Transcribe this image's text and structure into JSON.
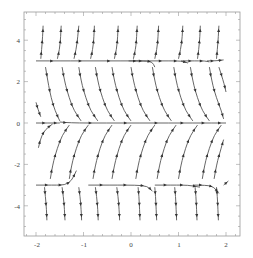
{
  "chart_data": {
    "type": "streamplot",
    "title": "",
    "xlabel": "",
    "ylabel": "",
    "xlim": [
      -2.25,
      2.25
    ],
    "ylim": [
      -5.4,
      5.4
    ],
    "grid": false,
    "legend": null,
    "x_ticks": [
      -2,
      -1,
      0,
      1,
      2
    ],
    "y_ticks": [
      -4,
      -2,
      0,
      2,
      4
    ],
    "x_tick_labels": [
      "-2",
      "-1",
      "0",
      "1",
      "2"
    ],
    "y_tick_labels": [
      "-4",
      "-2",
      "0",
      "2",
      "4"
    ],
    "separatrices_y": [
      3,
      0,
      -3
    ],
    "colors": {
      "stream": "#555555",
      "arrow": "#333333",
      "frame": "#999999",
      "text": "#444444"
    },
    "streamlines": [
      {
        "pts": [
          [
            -2,
            3
          ],
          [
            -1.4,
            3
          ],
          [
            -0.8,
            3
          ],
          [
            -0.2,
            3
          ],
          [
            0.3,
            3
          ],
          [
            0.45,
            2.95
          ],
          [
            0.5,
            2.7
          ]
        ]
      },
      {
        "pts": [
          [
            -0.05,
            3
          ],
          [
            0.4,
            3
          ],
          [
            0.8,
            3
          ],
          [
            1.05,
            3
          ],
          [
            1.2,
            2.9
          ]
        ]
      },
      {
        "pts": [
          [
            1.05,
            3
          ],
          [
            1.4,
            3
          ],
          [
            1.55,
            3
          ],
          [
            1.65,
            2.95
          ]
        ]
      },
      {
        "pts": [
          [
            1.6,
            3
          ],
          [
            1.8,
            3
          ],
          [
            1.95,
            3.05
          ]
        ]
      },
      {
        "pts": [
          [
            -2,
            0
          ],
          [
            -1.7,
            0
          ],
          [
            -1.5,
            0
          ]
        ]
      },
      {
        "pts": [
          [
            -1.5,
            0.05
          ],
          [
            -1.3,
            0
          ],
          [
            -0.5,
            0
          ],
          [
            0.2,
            0
          ],
          [
            0.8,
            0
          ],
          [
            1.3,
            0
          ],
          [
            1.7,
            0
          ],
          [
            2,
            0
          ]
        ]
      },
      {
        "pts": [
          [
            -2,
            -3
          ],
          [
            -1.6,
            -3
          ],
          [
            -1.4,
            -3
          ],
          [
            -1.25,
            -2.8
          ],
          [
            -1.15,
            -2.3
          ]
        ]
      },
      {
        "pts": [
          [
            -0.9,
            -3
          ],
          [
            -0.4,
            -3
          ],
          [
            0.1,
            -3
          ],
          [
            0.35,
            -3.05
          ],
          [
            0.45,
            -3.3
          ]
        ]
      },
      {
        "pts": [
          [
            0.5,
            -3
          ],
          [
            0.9,
            -3
          ],
          [
            1.2,
            -3
          ],
          [
            1.45,
            -3.1
          ]
        ]
      },
      {
        "pts": [
          [
            1.3,
            -3
          ],
          [
            1.6,
            -3
          ],
          [
            1.75,
            -3.1
          ],
          [
            1.85,
            -3.4
          ]
        ]
      },
      {
        "pts": [
          [
            1.95,
            -3
          ],
          [
            2.05,
            -2.8
          ]
        ]
      },
      {
        "pts": [
          [
            -1.9,
            3.1
          ],
          [
            -1.88,
            3.6
          ],
          [
            -1.86,
            4.2
          ],
          [
            -1.85,
            4.7
          ]
        ]
      },
      {
        "pts": [
          [
            -1.55,
            3.1
          ],
          [
            -1.5,
            3.6
          ],
          [
            -1.48,
            4.2
          ],
          [
            -1.47,
            4.7
          ]
        ]
      },
      {
        "pts": [
          [
            -1.2,
            3.1
          ],
          [
            -1.15,
            3.6
          ],
          [
            -1.12,
            4.2
          ],
          [
            -1.1,
            4.7
          ]
        ]
      },
      {
        "pts": [
          [
            -0.85,
            3.1
          ],
          [
            -0.8,
            3.6
          ],
          [
            -0.78,
            4.2
          ],
          [
            -0.77,
            4.7
          ]
        ]
      },
      {
        "pts": [
          [
            -0.35,
            3.1
          ],
          [
            -0.3,
            3.6
          ],
          [
            -0.28,
            4.2
          ],
          [
            -0.27,
            4.7
          ]
        ]
      },
      {
        "pts": [
          [
            0.05,
            3.1
          ],
          [
            0.1,
            3.6
          ],
          [
            0.12,
            4.2
          ],
          [
            0.13,
            4.7
          ]
        ]
      },
      {
        "pts": [
          [
            0.5,
            3.1
          ],
          [
            0.55,
            3.6
          ],
          [
            0.57,
            4.2
          ],
          [
            0.58,
            4.7
          ]
        ]
      },
      {
        "pts": [
          [
            1.0,
            3.1
          ],
          [
            1.05,
            3.6
          ],
          [
            1.08,
            4.2
          ],
          [
            1.09,
            4.7
          ]
        ]
      },
      {
        "pts": [
          [
            1.4,
            3.1
          ],
          [
            1.43,
            3.6
          ],
          [
            1.45,
            4.2
          ],
          [
            1.46,
            4.7
          ]
        ]
      },
      {
        "pts": [
          [
            1.8,
            3.1
          ],
          [
            1.82,
            3.6
          ],
          [
            1.84,
            4.2
          ],
          [
            1.85,
            4.7
          ]
        ]
      },
      {
        "pts": [
          [
            -1.8,
            2.7
          ],
          [
            -1.75,
            2.0
          ],
          [
            -1.68,
            1.2
          ],
          [
            -1.6,
            0.6
          ],
          [
            -1.5,
            0.1
          ]
        ]
      },
      {
        "pts": [
          [
            -1.45,
            2.7
          ],
          [
            -1.4,
            2.0
          ],
          [
            -1.3,
            1.2
          ],
          [
            -1.2,
            0.6
          ],
          [
            -1.05,
            0.1
          ]
        ]
      },
      {
        "pts": [
          [
            -1.1,
            2.7
          ],
          [
            -1.05,
            2.0
          ],
          [
            -0.95,
            1.2
          ],
          [
            -0.85,
            0.6
          ],
          [
            -0.7,
            0.1
          ]
        ]
      },
      {
        "pts": [
          [
            -0.75,
            2.7
          ],
          [
            -0.7,
            2.0
          ],
          [
            -0.6,
            1.2
          ],
          [
            -0.5,
            0.6
          ],
          [
            -0.35,
            0.1
          ]
        ]
      },
      {
        "pts": [
          [
            -0.4,
            2.7
          ],
          [
            -0.35,
            2.0
          ],
          [
            -0.25,
            1.2
          ],
          [
            -0.15,
            0.6
          ],
          [
            0.0,
            0.1
          ]
        ]
      },
      {
        "pts": [
          [
            0.0,
            2.7
          ],
          [
            0.05,
            2.0
          ],
          [
            0.15,
            1.2
          ],
          [
            0.25,
            0.6
          ],
          [
            0.4,
            0.1
          ]
        ]
      },
      {
        "pts": [
          [
            0.45,
            2.7
          ],
          [
            0.5,
            2.0
          ],
          [
            0.6,
            1.2
          ],
          [
            0.7,
            0.6
          ],
          [
            0.85,
            0.1
          ]
        ]
      },
      {
        "pts": [
          [
            0.9,
            2.7
          ],
          [
            0.95,
            2.0
          ],
          [
            1.05,
            1.2
          ],
          [
            1.15,
            0.6
          ],
          [
            1.3,
            0.1
          ]
        ]
      },
      {
        "pts": [
          [
            1.25,
            2.7
          ],
          [
            1.3,
            2.0
          ],
          [
            1.4,
            1.2
          ],
          [
            1.5,
            0.6
          ],
          [
            1.65,
            0.1
          ]
        ]
      },
      {
        "pts": [
          [
            1.65,
            2.7
          ],
          [
            1.7,
            2.0
          ],
          [
            1.8,
            1.2
          ],
          [
            1.9,
            0.6
          ],
          [
            1.95,
            0.2
          ]
        ]
      },
      {
        "pts": [
          [
            1.85,
            2.7
          ],
          [
            1.95,
            2.0
          ],
          [
            2.0,
            1.5
          ]
        ]
      },
      {
        "pts": [
          [
            -2.0,
            1.0
          ],
          [
            -1.95,
            0.6
          ],
          [
            -1.9,
            0.3
          ]
        ]
      },
      {
        "pts": [
          [
            -1.95,
            -1.2
          ],
          [
            -1.9,
            -0.7
          ],
          [
            -1.8,
            -0.3
          ],
          [
            -1.65,
            -0.05
          ]
        ]
      },
      {
        "pts": [
          [
            -1.7,
            -2.7
          ],
          [
            -1.65,
            -2.0
          ],
          [
            -1.55,
            -1.2
          ],
          [
            -1.45,
            -0.6
          ],
          [
            -1.3,
            -0.1
          ]
        ]
      },
      {
        "pts": [
          [
            -1.3,
            -2.7
          ],
          [
            -1.25,
            -2.0
          ],
          [
            -1.15,
            -1.2
          ],
          [
            -1.05,
            -0.6
          ],
          [
            -0.9,
            -0.1
          ]
        ]
      },
      {
        "pts": [
          [
            -0.8,
            -2.7
          ],
          [
            -0.75,
            -2.0
          ],
          [
            -0.65,
            -1.2
          ],
          [
            -0.55,
            -0.6
          ],
          [
            -0.4,
            -0.1
          ]
        ]
      },
      {
        "pts": [
          [
            -0.4,
            -2.7
          ],
          [
            -0.35,
            -2.0
          ],
          [
            -0.25,
            -1.2
          ],
          [
            -0.15,
            -0.6
          ],
          [
            0.0,
            -0.1
          ]
        ]
      },
      {
        "pts": [
          [
            0.1,
            -2.7
          ],
          [
            0.15,
            -2.0
          ],
          [
            0.25,
            -1.2
          ],
          [
            0.35,
            -0.6
          ],
          [
            0.5,
            -0.1
          ]
        ]
      },
      {
        "pts": [
          [
            0.55,
            -2.7
          ],
          [
            0.6,
            -2.0
          ],
          [
            0.7,
            -1.2
          ],
          [
            0.8,
            -0.6
          ],
          [
            0.95,
            -0.1
          ]
        ]
      },
      {
        "pts": [
          [
            1.0,
            -2.7
          ],
          [
            1.05,
            -2.0
          ],
          [
            1.15,
            -1.2
          ],
          [
            1.25,
            -0.6
          ],
          [
            1.4,
            -0.1
          ]
        ]
      },
      {
        "pts": [
          [
            1.5,
            -2.7
          ],
          [
            1.55,
            -2.0
          ],
          [
            1.65,
            -1.2
          ],
          [
            1.75,
            -0.6
          ],
          [
            1.9,
            -0.1
          ]
        ]
      },
      {
        "pts": [
          [
            1.75,
            -2.7
          ],
          [
            1.8,
            -2.0
          ],
          [
            1.9,
            -1.2
          ],
          [
            1.95,
            -0.8
          ]
        ]
      },
      {
        "pts": [
          [
            -1.82,
            -3.1
          ],
          [
            -1.8,
            -3.6
          ],
          [
            -1.78,
            -4.2
          ],
          [
            -1.77,
            -4.7
          ]
        ]
      },
      {
        "pts": [
          [
            -1.45,
            -3.1
          ],
          [
            -1.42,
            -3.6
          ],
          [
            -1.4,
            -4.2
          ],
          [
            -1.39,
            -4.7
          ]
        ]
      },
      {
        "pts": [
          [
            -1.1,
            -3.1
          ],
          [
            -1.07,
            -3.6
          ],
          [
            -1.05,
            -4.2
          ],
          [
            -1.04,
            -4.7
          ]
        ]
      },
      {
        "pts": [
          [
            -0.75,
            -3.1
          ],
          [
            -0.72,
            -3.6
          ],
          [
            -0.7,
            -4.2
          ],
          [
            -0.69,
            -4.7
          ]
        ]
      },
      {
        "pts": [
          [
            -0.3,
            -3.1
          ],
          [
            -0.27,
            -3.6
          ],
          [
            -0.25,
            -4.2
          ],
          [
            -0.24,
            -4.7
          ]
        ]
      },
      {
        "pts": [
          [
            0.15,
            -3.1
          ],
          [
            0.17,
            -3.6
          ],
          [
            0.18,
            -4.2
          ],
          [
            0.19,
            -4.7
          ]
        ]
      },
      {
        "pts": [
          [
            0.5,
            -3.1
          ],
          [
            0.52,
            -3.6
          ],
          [
            0.53,
            -4.2
          ],
          [
            0.54,
            -4.7
          ]
        ]
      },
      {
        "pts": [
          [
            0.92,
            -3.1
          ],
          [
            0.94,
            -3.6
          ],
          [
            0.95,
            -4.2
          ],
          [
            0.96,
            -4.7
          ]
        ]
      },
      {
        "pts": [
          [
            1.35,
            -3.1
          ],
          [
            1.37,
            -3.6
          ],
          [
            1.38,
            -4.2
          ],
          [
            1.39,
            -4.7
          ]
        ]
      },
      {
        "pts": [
          [
            1.8,
            -3.1
          ],
          [
            1.82,
            -3.6
          ],
          [
            1.83,
            -4.2
          ],
          [
            1.84,
            -4.7
          ]
        ]
      }
    ]
  }
}
